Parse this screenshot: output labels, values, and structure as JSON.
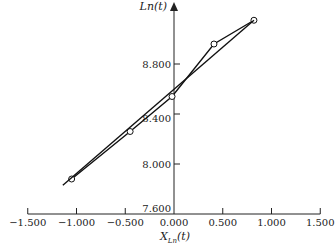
{
  "chart_data": {
    "type": "line",
    "title": "",
    "xlabel": "X_{Ln}(t)",
    "xlabel_main": "X",
    "xlabel_sub": "Ln",
    "xlabel_tail": "(t)",
    "ylabel": "Ln(t)",
    "xlim": [
      -1.5,
      1.5
    ],
    "ylim": [
      7.6,
      9.2
    ],
    "x_ticks": [
      -1.5,
      -1.0,
      -0.5,
      0.0,
      0.5,
      1.0,
      1.5
    ],
    "x_tick_labels": [
      "−1.500",
      "−1.000",
      "−0.500",
      "0.000",
      "0.500",
      "1.000",
      "1.500"
    ],
    "y_ticks": [
      7.6,
      8.0,
      8.4,
      8.8
    ],
    "y_tick_labels": [
      "7.600",
      "8.000",
      "8.400",
      "8.800"
    ],
    "grid": false,
    "legend": null,
    "series": [
      {
        "name": "observed",
        "style": "line-with-open-circles",
        "x": [
          -1.05,
          -0.45,
          -0.02,
          0.41,
          0.82
        ],
        "y": [
          7.88,
          8.26,
          8.54,
          8.96,
          9.15
        ]
      },
      {
        "name": "fitted line",
        "style": "straight-line",
        "x": [
          -1.14,
          0.82
        ],
        "y": [
          7.83,
          9.15
        ]
      }
    ]
  }
}
